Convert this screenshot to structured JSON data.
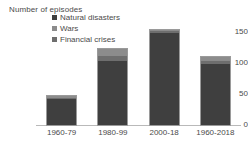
{
  "chart_data": {
    "type": "bar",
    "stacked": true,
    "title": "Number of episodes",
    "xlabel": "",
    "ylabel": "Number of episodes",
    "ylim": [
      0,
      150
    ],
    "yticks": [
      "0",
      "50",
      "100",
      "150"
    ],
    "grid": false,
    "legend_position": "top-left-inside",
    "categories": [
      "1960-79",
      "1980-99",
      "2000-18",
      "1960-2018"
    ],
    "series": [
      {
        "name": "Natural disasters",
        "color": "#3f3f3f",
        "values": [
          42,
          103,
          148,
          98
        ]
      },
      {
        "name": "Wars",
        "color": "#8c8c8c",
        "values": [
          3,
          10,
          3,
          6
        ]
      },
      {
        "name": "Financial crises",
        "color": "#6e6e6e",
        "values": [
          2,
          9,
          3,
          5
        ]
      }
    ],
    "totals": [
      47,
      122,
      154,
      109
    ]
  },
  "axis": {
    "title": "Number of episodes",
    "ticks": {
      "t0": "0",
      "t50": "50",
      "t100": "100",
      "t150": "150"
    }
  },
  "legend": {
    "items": [
      {
        "label": "Natural disasters",
        "color": "#3f3f3f"
      },
      {
        "label": "Wars",
        "color": "#8c8c8c"
      },
      {
        "label": "Financial crises",
        "color": "#6e6e6e"
      }
    ]
  },
  "xaxis": {
    "labels": [
      "1960-79",
      "1980-99",
      "2000-18",
      "1960-2018"
    ]
  }
}
